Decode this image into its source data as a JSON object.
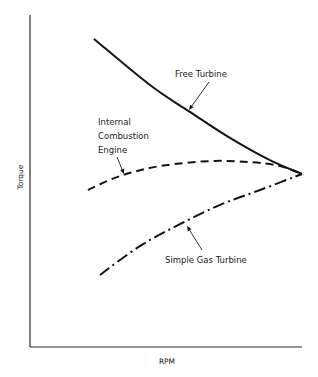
{
  "chart_data": {
    "type": "line",
    "title": "",
    "xlabel": "RPM",
    "ylabel": "Torque",
    "xlim": [
      0,
      1
    ],
    "ylim": [
      0,
      1
    ],
    "grid": false,
    "legend": "none (curves labeled inline with arrows)",
    "ticks": "none",
    "series": [
      {
        "name": "Free Turbine",
        "style": "solid",
        "x": [
          0.235,
          0.441,
          0.588,
          0.735,
          0.882,
          1.0
        ],
        "y": [
          0.928,
          0.789,
          0.708,
          0.63,
          0.563,
          0.521
        ]
      },
      {
        "name": "Internal Combustion Engine",
        "style": "dashed",
        "x": [
          0.213,
          0.331,
          0.478,
          0.662,
          0.809,
          0.919,
          1.0
        ],
        "y": [
          0.473,
          0.515,
          0.545,
          0.56,
          0.557,
          0.545,
          0.521
        ]
      },
      {
        "name": "Simple Gas Turbine",
        "style": "dash-dot",
        "x": [
          0.257,
          0.404,
          0.551,
          0.699,
          0.846,
          1.0
        ],
        "y": [
          0.217,
          0.304,
          0.37,
          0.428,
          0.473,
          0.521
        ]
      }
    ],
    "annotations": [
      {
        "series": "Free Turbine",
        "lines": [
          "Free Turbine"
        ],
        "text_pos": [
          175,
          77
        ],
        "arrow_from": [
          209,
          82
        ],
        "arrow_to": [
          189,
          110
        ]
      },
      {
        "series": "Internal Combustion Engine",
        "lines": [
          "Internal",
          "Combustion",
          "Engine"
        ],
        "text_pos": [
          98,
          125
        ],
        "line_height": 14,
        "arrow_from": [
          117,
          157
        ],
        "arrow_to": [
          124,
          174
        ]
      },
      {
        "series": "Simple Gas Turbine",
        "lines": [
          "Simple Gas Turbine"
        ],
        "text_pos": [
          165,
          263
        ],
        "arrow_from": [
          202,
          250
        ],
        "arrow_to": [
          187,
          226
        ]
      }
    ]
  },
  "layout": {
    "plot_left": 30,
    "plot_right": 302,
    "plot_top": 15,
    "plot_bottom": 347
  },
  "colors": {
    "ink": "#141414",
    "axis": "#2a2a2a",
    "background": "#ffffff"
  },
  "labels": {
    "x_axis": "RPM",
    "y_axis": "Torque"
  }
}
